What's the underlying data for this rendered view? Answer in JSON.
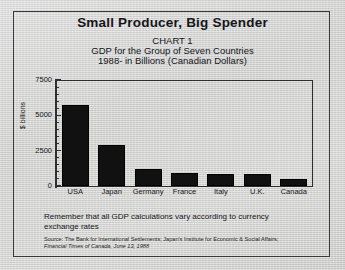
{
  "header": {
    "main_title": "Small Producer, Big Spender",
    "chart_number": "CHART 1",
    "subtitle_line_1": "GDP for the Group of Seven Countries",
    "subtitle_line_2": "1988- in Billions (Canadian Dollars)"
  },
  "note": "Remember that all GDP calculations vary according to currency exchange rates",
  "source": {
    "line_1": "Source: The Bank for International Settlements; Japan's Institute for Economic & Social Affairs;",
    "line_2": "Financial Times of Canada, June 13, 1988"
  },
  "axis": {
    "y_title": "$ billions",
    "tick_labels": [
      "7500",
      "5000",
      "2500",
      "0"
    ]
  },
  "colors": {
    "bar_fill": "#111111",
    "axis": "#2e2e2e",
    "text": "#15151a",
    "paper": "#d2d2d0",
    "border": "#3a3a3a"
  },
  "chart_data": {
    "type": "bar",
    "title": "Small Producer, Big Spender",
    "subtitle": "CHART 1 — GDP for the Group of Seven Countries, 1988- in Billions (Canadian Dollars)",
    "xlabel": "",
    "ylabel": "$ billions",
    "ylim": [
      0,
      7500
    ],
    "yticks": [
      0,
      2500,
      5000,
      7500
    ],
    "minor_tick_step": 500,
    "grid": false,
    "legend": false,
    "categories": [
      "USA",
      "Japan",
      "West Germany",
      "France",
      "Italy",
      "U.K.",
      "Canada"
    ],
    "category_lines": [
      [
        "USA"
      ],
      [
        "Japan"
      ],
      [
        "West",
        "Germany"
      ],
      [
        "France"
      ],
      [
        "Italy"
      ],
      [
        "U.K."
      ],
      [
        "Canada"
      ]
    ],
    "values": [
      5700,
      2900,
      1200,
      950,
      830,
      820,
      490
    ],
    "units": "Billions of Canadian Dollars",
    "year": 1988
  }
}
